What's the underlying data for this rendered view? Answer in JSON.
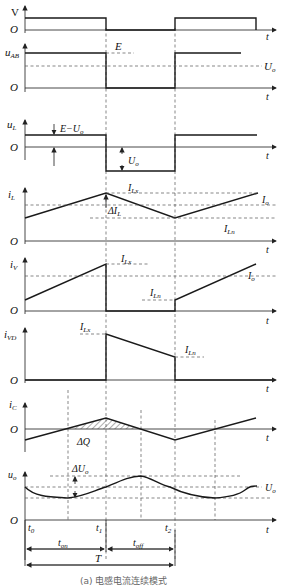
{
  "figure": {
    "caption": "(a) 电感电流连续模式",
    "time_axis_label": "t",
    "origin_label": "O",
    "time_markers": [
      "t0",
      "t1",
      "t2"
    ],
    "intervals": {
      "on": "t_on",
      "off": "t_off",
      "period": "T"
    }
  },
  "panels": [
    {
      "id": "gate",
      "ylabel": "V",
      "labels": []
    },
    {
      "id": "uAB",
      "ylabel": "u_AB",
      "labels": [
        "E",
        "U_o"
      ]
    },
    {
      "id": "uL",
      "ylabel": "u_L",
      "labels": [
        "E−U_o",
        "U_o"
      ]
    },
    {
      "id": "iL",
      "ylabel": "i_L",
      "labels": [
        "I_Lx",
        "ΔI_L",
        "I_o",
        "I_Ln"
      ]
    },
    {
      "id": "iV",
      "ylabel": "i_V",
      "labels": [
        "I_Lx",
        "I_o",
        "I_Ln"
      ]
    },
    {
      "id": "iVD",
      "ylabel": "i_VD",
      "labels": [
        "I_Lx",
        "I_Ln"
      ]
    },
    {
      "id": "iC",
      "ylabel": "i_C",
      "labels": [
        "ΔQ"
      ]
    },
    {
      "id": "uo",
      "ylabel": "u_o",
      "labels": [
        "ΔU_o",
        "U_o"
      ]
    }
  ],
  "text": {
    "V": "V",
    "O": "O",
    "t": "t",
    "u": "u",
    "i": "i",
    "AB": "AB",
    "L": "L",
    "Vsub": "V",
    "VD": "VD",
    "C": "C",
    "o": "o",
    "E": "E",
    "EmU": "E−U",
    "U": "U",
    "I": "I",
    "Lx": "Lx",
    "Ln": "Ln",
    "dI": "ΔI",
    "dQ": "ΔQ",
    "dU": "ΔU",
    "t0": "0",
    "t1": "1",
    "t2": "2",
    "on": "on",
    "off": "off",
    "T": "T",
    "caption": "(a) 电感电流连续模式"
  }
}
